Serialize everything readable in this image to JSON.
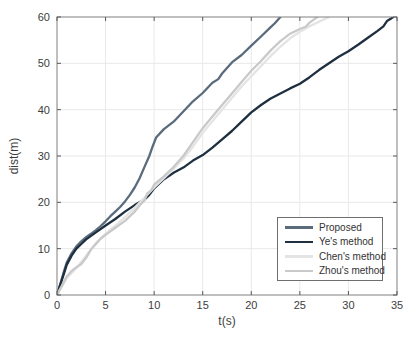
{
  "figure": {
    "background": "#ffffff",
    "axis_box_color": "#808080",
    "tick_color": "#595959",
    "grid_color": "#e9e9e9",
    "tick_label_color": "#3d3d3d",
    "legend_border_color": "#6e6e6e"
  },
  "chart_data": {
    "type": "line",
    "title": "",
    "xlabel": "t(s)",
    "ylabel": "dist(m)",
    "xlim": [
      0,
      35
    ],
    "ylim": [
      0,
      60
    ],
    "xticks": [
      0,
      5,
      10,
      15,
      20,
      25,
      30,
      35
    ],
    "yticks": [
      0,
      10,
      20,
      30,
      40,
      50,
      60
    ],
    "grid": true,
    "legend_position": "inside-lower-right",
    "series": [
      {
        "name": "Proposed",
        "color": "#5a6b7c",
        "points": [
          [
            0,
            0
          ],
          [
            0.3,
            2
          ],
          [
            0.7,
            5
          ],
          [
            1,
            7
          ],
          [
            1.5,
            9
          ],
          [
            2,
            10.5
          ],
          [
            2.5,
            11.6
          ],
          [
            3,
            12.5
          ],
          [
            3.5,
            13.2
          ],
          [
            4,
            14
          ],
          [
            4.5,
            14.9
          ],
          [
            5,
            15.9
          ],
          [
            5.5,
            17
          ],
          [
            6,
            18
          ],
          [
            6.5,
            19
          ],
          [
            7,
            20.2
          ],
          [
            7.5,
            21.6
          ],
          [
            8,
            23.2
          ],
          [
            8.5,
            25.2
          ],
          [
            9,
            27.6
          ],
          [
            9.5,
            30
          ],
          [
            9.8,
            31.8
          ],
          [
            10.2,
            34
          ],
          [
            11,
            35.8
          ],
          [
            12,
            37.4
          ],
          [
            13,
            39.6
          ],
          [
            14,
            41.8
          ],
          [
            15,
            43.6
          ],
          [
            16,
            45.8
          ],
          [
            16.6,
            46.6
          ],
          [
            17,
            47.8
          ],
          [
            18,
            50.2
          ],
          [
            19,
            51.8
          ],
          [
            20,
            53.8
          ],
          [
            21,
            55.8
          ],
          [
            22,
            57.8
          ],
          [
            22.4,
            58.6
          ],
          [
            23,
            60
          ]
        ]
      },
      {
        "name": "Ye's method",
        "color": "#1e2f40",
        "points": [
          [
            0,
            0
          ],
          [
            0.3,
            2
          ],
          [
            0.7,
            4.5
          ],
          [
            1,
            6.5
          ],
          [
            1.5,
            8.5
          ],
          [
            2,
            10
          ],
          [
            2.5,
            11
          ],
          [
            3,
            12
          ],
          [
            4,
            13.5
          ],
          [
            5,
            15
          ],
          [
            6,
            16.4
          ],
          [
            7,
            18
          ],
          [
            8,
            19.4
          ],
          [
            9,
            20.6
          ],
          [
            9.5,
            21.6
          ],
          [
            10,
            23
          ],
          [
            11,
            25
          ],
          [
            12,
            26.4
          ],
          [
            13,
            27.5
          ],
          [
            14,
            29
          ],
          [
            15,
            30.2
          ],
          [
            16,
            31.8
          ],
          [
            17,
            33.6
          ],
          [
            18,
            35.4
          ],
          [
            19,
            37.4
          ],
          [
            20,
            39.4
          ],
          [
            21,
            41
          ],
          [
            22,
            42.4
          ],
          [
            23,
            43.5
          ],
          [
            24,
            44.6
          ],
          [
            25,
            45.6
          ],
          [
            26,
            47
          ],
          [
            27,
            48.6
          ],
          [
            28,
            50
          ],
          [
            29,
            51.4
          ],
          [
            30,
            52.6
          ],
          [
            31,
            54
          ],
          [
            32,
            55.5
          ],
          [
            33,
            57
          ],
          [
            33.6,
            58
          ],
          [
            34,
            59.2
          ],
          [
            34.4,
            59.7
          ],
          [
            34.6,
            60
          ]
        ]
      },
      {
        "name": "Chen's method",
        "color": "#e4e4e4",
        "points": [
          [
            0,
            0
          ],
          [
            0.5,
            1.8
          ],
          [
            1,
            3.6
          ],
          [
            2,
            5.8
          ],
          [
            3,
            8.5
          ],
          [
            4,
            11.2
          ],
          [
            5,
            13.2
          ],
          [
            6,
            15
          ],
          [
            7,
            16.8
          ],
          [
            8,
            18.8
          ],
          [
            9,
            21
          ],
          [
            10,
            23.2
          ],
          [
            11,
            25.2
          ],
          [
            12,
            27.2
          ],
          [
            13,
            29.4
          ],
          [
            14,
            32
          ],
          [
            15,
            35
          ],
          [
            16,
            37.5
          ],
          [
            17,
            40
          ],
          [
            18,
            42.5
          ],
          [
            19,
            45
          ],
          [
            20,
            47.2
          ],
          [
            21,
            49.4
          ],
          [
            22,
            51.6
          ],
          [
            23,
            53.6
          ],
          [
            24,
            55.4
          ],
          [
            25,
            56.8
          ],
          [
            26,
            58
          ],
          [
            27,
            59
          ],
          [
            28,
            60
          ]
        ]
      },
      {
        "name": "Zhou's method",
        "color": "#c9c9c9",
        "points": [
          [
            0,
            0
          ],
          [
            0.5,
            2
          ],
          [
            1,
            4
          ],
          [
            1.5,
            5.2
          ],
          [
            2,
            6
          ],
          [
            2.5,
            6.7
          ],
          [
            3,
            8
          ],
          [
            3.5,
            9.8
          ],
          [
            4,
            11
          ],
          [
            4.5,
            12.2
          ],
          [
            5,
            13
          ],
          [
            6,
            14.5
          ],
          [
            7,
            16
          ],
          [
            8,
            18
          ],
          [
            8.7,
            19.8
          ],
          [
            9,
            20.4
          ],
          [
            9.3,
            21.9
          ],
          [
            9.7,
            22.6
          ],
          [
            10,
            23.8
          ],
          [
            11,
            25.6
          ],
          [
            12,
            27.6
          ],
          [
            13,
            30
          ],
          [
            14,
            33
          ],
          [
            15,
            36
          ],
          [
            16,
            38.5
          ],
          [
            17,
            41
          ],
          [
            18,
            43.5
          ],
          [
            19,
            46
          ],
          [
            20,
            48.4
          ],
          [
            21,
            50.5
          ],
          [
            22,
            52.8
          ],
          [
            23,
            54.8
          ],
          [
            24,
            56.4
          ],
          [
            25,
            57.4
          ],
          [
            25.6,
            57.9
          ],
          [
            26,
            58.8
          ],
          [
            26.8,
            60
          ]
        ]
      }
    ]
  }
}
